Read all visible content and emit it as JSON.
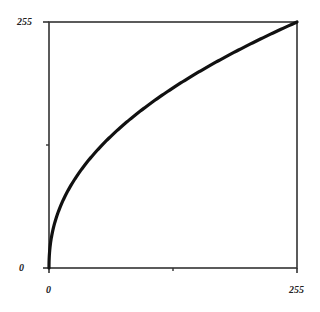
{
  "chart_data": {
    "type": "line",
    "title": "",
    "xlabel": "",
    "ylabel": "",
    "xlim": [
      0,
      255
    ],
    "ylim": [
      0,
      255
    ],
    "grid": false,
    "legend": null,
    "x_ticks": [
      0,
      127.5,
      255
    ],
    "x_tick_labels": [
      "0",
      "",
      "255"
    ],
    "y_ticks": [
      0,
      127.5,
      255
    ],
    "y_tick_labels": [
      "0",
      "",
      "255"
    ],
    "series": [
      {
        "name": "gamma curve",
        "gamma": 0.45,
        "color": "#111111",
        "x": [
          0,
          1,
          5,
          16,
          32,
          64,
          96,
          128,
          160,
          192,
          224,
          255
        ],
        "values": [
          0,
          21,
          43,
          74,
          100,
          137,
          164,
          187,
          207,
          224,
          240,
          255
        ]
      }
    ]
  },
  "labels": {
    "y_max": "255",
    "y_min": "0",
    "x_min": "0",
    "x_max": "255"
  },
  "colors": {
    "axis": "#333333",
    "curve": "#111111",
    "background": "#ffffff"
  }
}
